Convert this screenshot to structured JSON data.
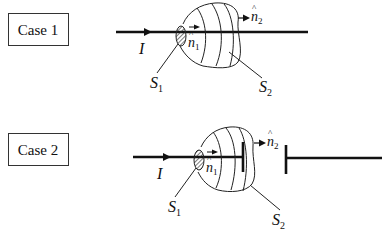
{
  "cases": [
    {
      "label": "Case 1",
      "current_label": "I",
      "surface1_label": "S",
      "surface1_sub": "1",
      "surface2_label": "S",
      "surface2_sub": "2",
      "normal1_label": "n",
      "normal1_sub": "1",
      "normal2_label": "n",
      "normal2_sub": "2",
      "hat": "^"
    },
    {
      "label": "Case 2",
      "current_label": "I",
      "surface1_label": "S",
      "surface1_sub": "1",
      "surface2_label": "S",
      "surface2_sub": "2",
      "normal1_label": "n",
      "normal1_sub": "1",
      "normal2_label": "n",
      "normal2_sub": "2",
      "hat": "^"
    }
  ],
  "colors": {
    "line": "#111111",
    "background": "#ffffff"
  }
}
